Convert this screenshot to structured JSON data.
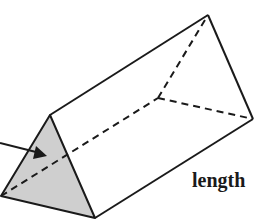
{
  "figure": {
    "type": "triangular-prism",
    "labels": {
      "length": "length"
    },
    "colors": {
      "stroke": "#1a1a1a",
      "front_face_fill": "#cfcfcf",
      "background": "#ffffff"
    },
    "vertices": {
      "front_apex": [
        50,
        115
      ],
      "front_left": [
        1,
        196
      ],
      "front_right": [
        95,
        218
      ],
      "back_apex": [
        208,
        15
      ],
      "back_right": [
        253,
        119
      ],
      "back_left_hidden": [
        158,
        98
      ]
    }
  }
}
